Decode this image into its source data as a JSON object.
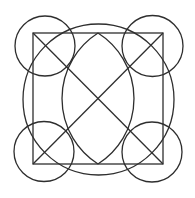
{
  "canvas": {
    "width": 195,
    "height": 198,
    "background": "#ffffff"
  },
  "style": {
    "stroke": "#2e2e2e",
    "stroke_width": 1.3
  },
  "square": {
    "x1": 33,
    "y1": 33,
    "x2": 163,
    "y2": 164
  },
  "diagonals": [
    {
      "x1": 33,
      "y1": 33,
      "x2": 163,
      "y2": 164
    },
    {
      "x1": 163,
      "y1": 33,
      "x2": 33,
      "y2": 164
    }
  ],
  "big_circle": {
    "cx": 98.5,
    "cy": 99.5,
    "r": 75.5
  },
  "corner_circles": [
    {
      "name": "top-left",
      "cx": 45,
      "cy": 46,
      "r": 30
    },
    {
      "name": "top-right",
      "cx": 152.5,
      "cy": 46,
      "r": 30.5
    },
    {
      "name": "bottom-left",
      "cx": 44,
      "cy": 151.5,
      "r": 30
    },
    {
      "name": "bottom-right",
      "cx": 152,
      "cy": 152,
      "r": 30
    }
  ],
  "lens": {
    "top": {
      "x": 98,
      "y": 33
    },
    "bottom": {
      "x": 98,
      "y": 164
    },
    "left_extent": 62,
    "right_extent": 135,
    "arc_radius": 77.6
  }
}
